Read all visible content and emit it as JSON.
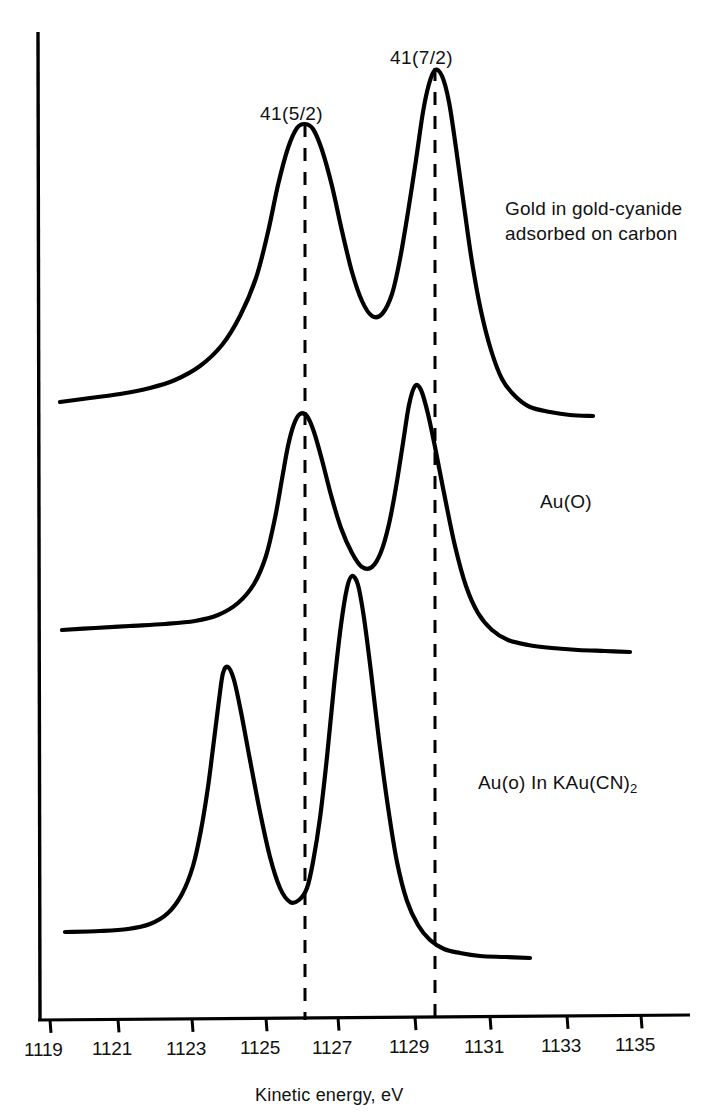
{
  "figure": {
    "kind": "xps-spectra",
    "background": "#ffffff",
    "ink": "#000000",
    "axis_title": "Kinetic energy, eV",
    "peak_labels": [
      {
        "text": "41(5/2)",
        "x": 305,
        "y": 103
      },
      {
        "text": "41(7/2)",
        "x": 435,
        "y": 47
      }
    ],
    "series_labels": [
      {
        "line1": "Gold in gold-cyanide",
        "line2": "adsorbed on carbon",
        "x": 505,
        "y": 196
      },
      {
        "line1": "Au(O)",
        "line2": "",
        "x": 540,
        "y": 489
      },
      {
        "line1": "Au(o) In KAu(CN)",
        "line2": "",
        "sub": "2",
        "x": 478,
        "y": 770
      }
    ],
    "guide_lines": [
      {
        "name": "guide-5-2",
        "x": 305,
        "y_top": 124,
        "y_bottom": 1020
      },
      {
        "name": "guide-7-2",
        "x": 435,
        "y_top": 68,
        "y_bottom": 1020
      }
    ]
  },
  "chart_data": {
    "type": "line",
    "title": "",
    "subtitle": "",
    "xlabel": "Kinetic energy, eV",
    "ylabel": "",
    "xlim": [
      1118.7,
      1136.3
    ],
    "grid": false,
    "legend": "inline-right",
    "tick_labels": [
      "1119",
      "1121",
      "1123",
      "1125",
      "1127",
      "1129",
      "1131",
      "1133",
      "1135"
    ],
    "tick_values": [
      1119,
      1121,
      1123,
      1125,
      1127,
      1129,
      1131,
      1133,
      1135
    ],
    "annotations": [
      {
        "label": "41(5/2)",
        "x": 1126.1,
        "note": "Au 4f(5/2) reference line"
      },
      {
        "label": "41(7/2)",
        "x": 1129.6,
        "note": "Au 4f(7/2) reference line"
      }
    ],
    "series": [
      {
        "name": "Gold in gold-cyanide adsorbed on carbon",
        "offset_px": 0,
        "baseline_y": 400,
        "peaks": [
          {
            "assignment": "4f(5/2)",
            "x": 1126.1,
            "height_px": 275,
            "fwhm_ev": 1.15
          },
          {
            "assignment": "4f(7/2)",
            "x": 1129.6,
            "height_px": 330,
            "fwhm_ev": 1.05
          }
        ],
        "points_px": [
          [
            60,
            402
          ],
          [
            90,
            398
          ],
          [
            120,
            394
          ],
          [
            150,
            388
          ],
          [
            175,
            380
          ],
          [
            200,
            366
          ],
          [
            222,
            345
          ],
          [
            240,
            316
          ],
          [
            256,
            278
          ],
          [
            268,
            232
          ],
          [
            278,
            185
          ],
          [
            288,
            148
          ],
          [
            297,
            128
          ],
          [
            305,
            124
          ],
          [
            313,
            129
          ],
          [
            322,
            150
          ],
          [
            332,
            186
          ],
          [
            342,
            231
          ],
          [
            352,
            272
          ],
          [
            362,
            301
          ],
          [
            372,
            316
          ],
          [
            382,
            314
          ],
          [
            392,
            294
          ],
          [
            400,
            259
          ],
          [
            408,
            212
          ],
          [
            416,
            160
          ],
          [
            423,
            112
          ],
          [
            429,
            84
          ],
          [
            435,
            70
          ],
          [
            442,
            76
          ],
          [
            449,
            102
          ],
          [
            456,
            148
          ],
          [
            464,
            206
          ],
          [
            472,
            262
          ],
          [
            481,
            311
          ],
          [
            491,
            350
          ],
          [
            502,
            379
          ],
          [
            515,
            396
          ],
          [
            530,
            407
          ],
          [
            550,
            412
          ],
          [
            570,
            415
          ],
          [
            593,
            416
          ]
        ]
      },
      {
        "name": "Au(O)",
        "offset_px": 0,
        "baseline_y": 628,
        "peaks": [
          {
            "assignment": "4f(5/2)",
            "x": 1125.6,
            "height_px": 215,
            "fwhm_ev": 1.1
          },
          {
            "assignment": "4f(7/2)",
            "x": 1128.9,
            "height_px": 250,
            "fwhm_ev": 1.05
          }
        ],
        "points_px": [
          [
            62,
            630
          ],
          [
            95,
            628
          ],
          [
            130,
            626
          ],
          [
            165,
            624
          ],
          [
            195,
            621
          ],
          [
            218,
            615
          ],
          [
            238,
            603
          ],
          [
            254,
            584
          ],
          [
            266,
            556
          ],
          [
            275,
            518
          ],
          [
            282,
            479
          ],
          [
            288,
            446
          ],
          [
            294,
            424
          ],
          [
            300,
            414
          ],
          [
            307,
            416
          ],
          [
            314,
            432
          ],
          [
            322,
            460
          ],
          [
            331,
            495
          ],
          [
            341,
            528
          ],
          [
            352,
            553
          ],
          [
            362,
            567
          ],
          [
            372,
            567
          ],
          [
            381,
            552
          ],
          [
            389,
            524
          ],
          [
            396,
            487
          ],
          [
            403,
            443
          ],
          [
            409,
            405
          ],
          [
            415,
            386
          ],
          [
            421,
            390
          ],
          [
            428,
            414
          ],
          [
            436,
            452
          ],
          [
            445,
            498
          ],
          [
            455,
            546
          ],
          [
            466,
            586
          ],
          [
            478,
            613
          ],
          [
            492,
            630
          ],
          [
            508,
            640
          ],
          [
            528,
            645
          ],
          [
            552,
            648
          ],
          [
            578,
            650
          ],
          [
            605,
            651
          ],
          [
            630,
            652
          ]
        ]
      },
      {
        "name": "Au(o) In KAu(CN)2",
        "offset_px": 0,
        "baseline_y": 930,
        "peaks": [
          {
            "assignment": "4f(5/2)",
            "x": 1123.9,
            "height_px": 262,
            "fwhm_ev": 1.25
          },
          {
            "assignment": "4f(7/2)",
            "x": 1127.4,
            "height_px": 352,
            "fwhm_ev": 1.2
          }
        ],
        "points_px": [
          [
            65,
            932
          ],
          [
            100,
            931
          ],
          [
            128,
            929
          ],
          [
            150,
            924
          ],
          [
            168,
            913
          ],
          [
            182,
            894
          ],
          [
            193,
            866
          ],
          [
            201,
            830
          ],
          [
            208,
            787
          ],
          [
            214,
            740
          ],
          [
            219,
            700
          ],
          [
            223,
            673
          ],
          [
            228,
            667
          ],
          [
            234,
            680
          ],
          [
            241,
            712
          ],
          [
            250,
            760
          ],
          [
            260,
            812
          ],
          [
            270,
            857
          ],
          [
            280,
            888
          ],
          [
            290,
            902
          ],
          [
            299,
            900
          ],
          [
            307,
            888
          ],
          [
            313,
            862
          ],
          [
            320,
            818
          ],
          [
            327,
            757
          ],
          [
            334,
            686
          ],
          [
            341,
            625
          ],
          [
            347,
            588
          ],
          [
            352,
            576
          ],
          [
            358,
            585
          ],
          [
            364,
            618
          ],
          [
            371,
            672
          ],
          [
            379,
            740
          ],
          [
            388,
            807
          ],
          [
            397,
            862
          ],
          [
            407,
            901
          ],
          [
            418,
            925
          ],
          [
            430,
            940
          ],
          [
            444,
            949
          ],
          [
            460,
            953
          ],
          [
            480,
            956
          ],
          [
            505,
            957
          ],
          [
            530,
            958
          ]
        ]
      }
    ]
  },
  "axis": {
    "y_axis": {
      "x": 38,
      "y_top": 32,
      "y_bottom": 1020
    },
    "x_axis": {
      "y": 1020,
      "x_left": 38,
      "x_right": 690
    },
    "ticks_px": [
      50,
      118,
      192,
      266,
      338,
      415,
      490,
      567,
      641
    ]
  }
}
